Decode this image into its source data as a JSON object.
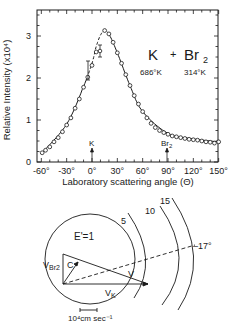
{
  "chart_data": {
    "type": "scatter",
    "subtitle": [
      "686°K",
      "314°K"
    ],
    "xlabel": "Laboratory scattering angle (Θ)",
    "ylabel": "Relative Intensity (x10⁴)",
    "xlim": [
      -60,
      150
    ],
    "ylim": [
      0,
      3.5
    ],
    "x_ticks": [
      "-60°",
      "-30°",
      "0°",
      "30°",
      "60°",
      "90°",
      "120°",
      "150°"
    ],
    "y_ticks": [
      "0",
      "1",
      "2",
      "3"
    ],
    "grid": false,
    "annotations": [
      {
        "label": "K",
        "x": 0,
        "type": "arrow-marker"
      },
      {
        "label": "Br2",
        "x": 88,
        "type": "arrow-marker"
      }
    ],
    "series": [
      {
        "name": "measured",
        "marker": "open-circle",
        "x": [
          -59,
          -55,
          -50,
          -45,
          -40,
          -35,
          -30,
          -25,
          -20,
          -15,
          -10,
          -5,
          0,
          5,
          10,
          15,
          20,
          25,
          30,
          35,
          40,
          45,
          50,
          55,
          60,
          65,
          70,
          75,
          80,
          85,
          90,
          95,
          100,
          105,
          110,
          115,
          120,
          125,
          130,
          135,
          140,
          145,
          150
        ],
        "y": [
          0.22,
          0.28,
          0.36,
          0.48,
          0.58,
          0.72,
          0.88,
          1.05,
          1.28,
          1.5,
          1.78,
          2.02,
          2.3,
          2.62,
          3.0,
          3.13,
          3.05,
          2.85,
          2.6,
          2.35,
          2.08,
          1.82,
          1.58,
          1.38,
          1.2,
          1.05,
          0.92,
          0.82,
          0.75,
          0.7,
          0.66,
          0.62,
          0.6,
          0.58,
          0.56,
          0.54,
          0.53,
          0.52,
          0.5,
          0.48,
          0.47,
          0.45,
          0.48
        ]
      },
      {
        "name": "fit",
        "style": "solid line, dashed near peak",
        "x": [
          -60,
          -30,
          -10,
          0,
          5,
          10,
          15,
          20,
          30,
          45,
          60,
          90,
          120,
          150
        ],
        "y": [
          0.2,
          0.9,
          1.8,
          2.35,
          2.75,
          3.02,
          3.13,
          3.05,
          2.6,
          1.82,
          1.2,
          0.68,
          0.55,
          0.48
        ]
      }
    ]
  },
  "diagram": {
    "circle_label": "E'=1",
    "contour_labels": [
      "5",
      "10",
      "15"
    ],
    "angle_label": "17°",
    "vectors": [
      "VBr2",
      "C",
      "V",
      "VK"
    ],
    "scale_label": "10⁴cm sec⁻¹"
  }
}
